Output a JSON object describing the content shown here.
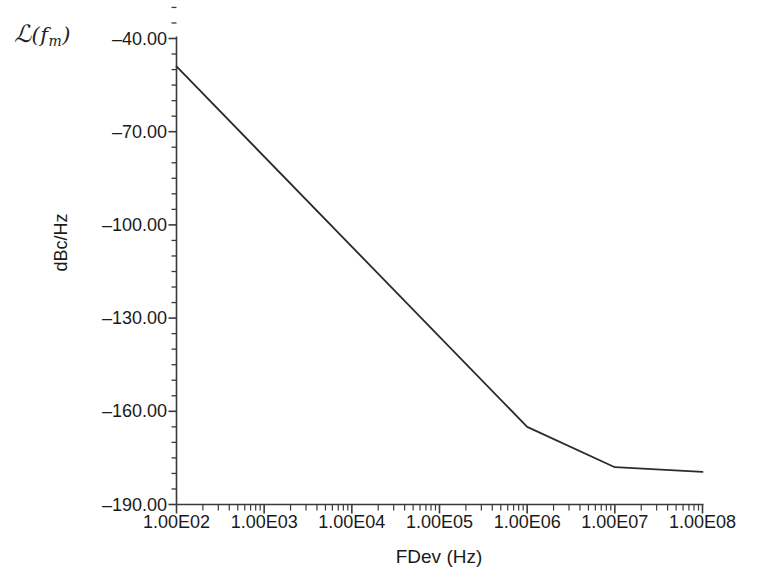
{
  "chart_data": {
    "type": "line",
    "title_parts": {
      "symbol": "ℒ",
      "open": "(",
      "arg": "f",
      "subscript": "m",
      "close": ")"
    },
    "xlabel": "FDev (Hz)",
    "ylabel": "dBc/Hz",
    "xscale": "log",
    "yscale": "linear",
    "xlim": [
      100,
      100000000
    ],
    "ylim": [
      -190,
      -40
    ],
    "grid": false,
    "legend": null,
    "xticks": [
      {
        "value": 100,
        "label": "1.00E02"
      },
      {
        "value": 1000,
        "label": "1.00E03"
      },
      {
        "value": 10000,
        "label": "1.00E04"
      },
      {
        "value": 100000,
        "label": "1.00E05"
      },
      {
        "value": 1000000,
        "label": "1.00E06"
      },
      {
        "value": 10000000,
        "label": "1.00E07"
      },
      {
        "value": 100000000,
        "label": "1.00E08"
      }
    ],
    "yticks": [
      {
        "value": -40,
        "label": "–40.00"
      },
      {
        "value": -70,
        "label": "–70.00"
      },
      {
        "value": -100,
        "label": "–100.00"
      },
      {
        "value": -130,
        "label": "–130.00"
      },
      {
        "value": -160,
        "label": "–160.00"
      },
      {
        "value": -190,
        "label": "–190.00"
      }
    ],
    "y_minor_per_major": 6,
    "series": [
      {
        "name": "phase noise",
        "color": "#2b2b2b",
        "line_width": 1.8,
        "x": [
          100,
          1000000,
          10000000,
          100000000
        ],
        "y": [
          -49.0,
          -165.0,
          -178.0,
          -179.5
        ]
      }
    ],
    "annotations": []
  },
  "caption": {
    "text": ""
  }
}
